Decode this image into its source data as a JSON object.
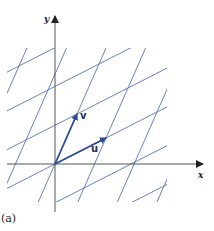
{
  "figure": {
    "caption": "(a)",
    "axes": {
      "x_label": "x",
      "y_label": "y",
      "origin_px": [
        55,
        164
      ],
      "x_axis_end_px": 203,
      "y_axis_end_px": 16,
      "color": "#555555"
    },
    "vectors": [
      {
        "name": "u",
        "label": "u",
        "tip_px": [
          106,
          138
        ],
        "color": "#2b4a9a"
      },
      {
        "name": "v",
        "label": "v",
        "tip_px": [
          77,
          114
        ],
        "color": "#2b4a9a"
      }
    ],
    "grid": {
      "description": "Skewed lattice of lines parallel to u and v",
      "color": "#5a74b8",
      "clip_region_px": {
        "x_min": 7,
        "x_max": 167,
        "y_min": 48,
        "y_max": 202
      },
      "lines_parallel_to_v": 9,
      "lines_parallel_to_u": 9
    }
  }
}
